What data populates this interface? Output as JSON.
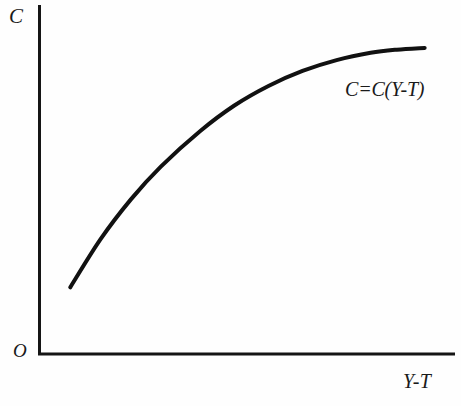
{
  "figure": {
    "background_color": "#fefefe",
    "ink_color": "#111111"
  },
  "labels": {
    "y_axis": "C",
    "x_axis": "Y-T",
    "origin": "O",
    "curve_annotation": "C=C(Y-T)"
  },
  "chart_data": {
    "type": "line",
    "title": "",
    "subtitle": "",
    "xlabel": "Y-T",
    "ylabel": "C",
    "origin_label": "O",
    "grid": false,
    "legend_position": "inline-annotation",
    "axis_style": "arrowless-open-axes",
    "xlim": [
      0,
      100
    ],
    "ylim": [
      0,
      100
    ],
    "xticks": [],
    "yticks": [],
    "xticklabels": [],
    "yticklabels": [],
    "annotations": [
      {
        "text": "C=C(Y-T)",
        "x": 74,
        "y": 78,
        "style": "italic"
      }
    ],
    "series": [
      {
        "name": "C=C(Y-T)",
        "description": "Concave increasing consumption function of disposable income",
        "color": "#111111",
        "linewidth": 4,
        "x": [
          7.4,
          14.7,
          22.0,
          29.2,
          38.7,
          46.9,
          55.1,
          63.3,
          71.5,
          79.7,
          86.0,
          92.7
        ],
        "y": [
          19.1,
          32.9,
          44.3,
          53.7,
          63.9,
          71.2,
          76.8,
          81.1,
          84.2,
          86.3,
          87.2,
          87.7
        ]
      }
    ]
  }
}
